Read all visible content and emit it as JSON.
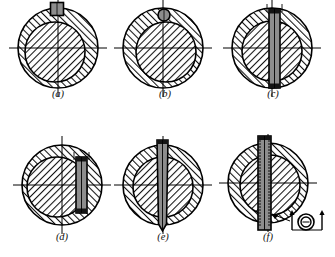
{
  "sheet": {
    "title": "Keyed and pinned shaft-hub connections (cross sections)",
    "background": "#ffffff",
    "line_color": "#000000",
    "hatch_color": "#1a1a1a",
    "key_fill": "#8d8d8d",
    "key_dark_fill": "#141414",
    "width": 335,
    "height": 257
  },
  "figures": [
    {
      "id": "a",
      "caption": "(a)",
      "key_type": "square-key",
      "key_label": "square parallel key at top",
      "cx": 58,
      "cy": 48,
      "hub_r": 40,
      "shaft_r": 30,
      "shaft_dx": -3,
      "shaft_dy": 4,
      "key": {
        "shape": "rect",
        "w": 13,
        "h": 13,
        "x": 57,
        "y": 9
      }
    },
    {
      "id": "b",
      "caption": "(b)",
      "key_type": "round-pin",
      "key_label": "round pin at top",
      "cx": 163,
      "cy": 48,
      "hub_r": 40,
      "shaft_r": 30,
      "shaft_dx": 3,
      "shaft_dy": 4,
      "key": {
        "shape": "circle",
        "r": 6,
        "x": 164,
        "y": 15
      }
    },
    {
      "id": "c",
      "caption": "(c)",
      "key_type": "through-bar-centered",
      "key_label": "flat bar through centre",
      "cx": 272,
      "cy": 48,
      "hub_r": 40,
      "shaft_r": 30,
      "shaft_dx": 0,
      "shaft_dy": 3,
      "key": {
        "shape": "bar",
        "w": 11,
        "top": 9,
        "bottom": 88,
        "x": 269
      }
    },
    {
      "id": "d",
      "caption": "(d)",
      "key_type": "offset-bar",
      "key_label": "flat bar offset to side",
      "cx": 62,
      "cy": 185,
      "hub_r": 40,
      "shaft_r": 30,
      "shaft_dx": -5,
      "shaft_dy": 2,
      "key": {
        "shape": "bar",
        "w": 11,
        "top": 157,
        "bottom": 213,
        "x": 76
      }
    },
    {
      "id": "e",
      "caption": "(e)",
      "key_type": "taper-pin",
      "key_label": "tapered pin through shaft",
      "cx": 163,
      "cy": 185,
      "hub_r": 40,
      "shaft_r": 30,
      "shaft_dx": 0,
      "shaft_dy": 2,
      "key": {
        "shape": "taper-pin",
        "w": 11,
        "top": 140,
        "bottom": 231,
        "x": 157
      }
    },
    {
      "id": "f",
      "caption": "(f)",
      "key_type": "splined-pin",
      "key_label": "grooved / splined pin with detail view",
      "cx": 268,
      "cy": 183,
      "hub_r": 40,
      "shaft_r": 30,
      "shaft_dx": 2,
      "shaft_dy": 2,
      "key": {
        "shape": "splined-pin",
        "w": 13,
        "top": 136,
        "bottom": 230,
        "x": 258
      },
      "detail": {
        "label": "section-detail-ring",
        "cx": 306,
        "cy": 222,
        "r_outer": 8,
        "r_inner": 5,
        "arrow_left_x": 292,
        "arrow_right_x": 322,
        "leader_from_x": 272,
        "leader_from_y": 214,
        "leader_to_x": 290,
        "leader_to_y": 221
      }
    }
  ]
}
